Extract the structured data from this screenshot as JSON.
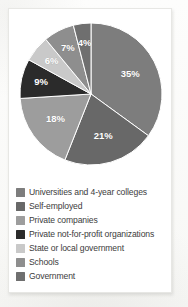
{
  "chart_data": {
    "type": "pie",
    "title": "",
    "labels": [
      "Universities and 4-year colleges",
      "Self-employed",
      "Private companies",
      "Private not-for-profit organizations",
      "State or local government",
      "Schools",
      "Government"
    ],
    "values": [
      35,
      21,
      18,
      9,
      6,
      7,
      4
    ],
    "value_labels": [
      "35%",
      "21%",
      "18%",
      "9%",
      "6%",
      "7%",
      "4%"
    ],
    "colors": [
      "#7d7d7d",
      "#686868",
      "#9d9d9d",
      "#2b2b2b",
      "#c9c9c9",
      "#8e8e8e",
      "#6f6f6f"
    ],
    "start_angle_deg": 0,
    "direction": "clockwise",
    "legend_position": "bottom",
    "grid": false
  },
  "legend": {
    "items": [
      {
        "label": "Universities and 4-year colleges",
        "color": "#7d7d7d",
        "value_label": "35%"
      },
      {
        "label": "Self-employed",
        "color": "#686868",
        "value_label": "21%"
      },
      {
        "label": "Private companies",
        "color": "#9d9d9d",
        "value_label": "18%"
      },
      {
        "label": "Private not-for-profit organizations",
        "color": "#2b2b2b",
        "value_label": "9%"
      },
      {
        "label": "State or local government",
        "color": "#c9c9c9",
        "value_label": "6%"
      },
      {
        "label": "Schools",
        "color": "#8e8e8e",
        "value_label": "7%"
      },
      {
        "label": "Government",
        "color": "#6f6f6f",
        "value_label": "4%"
      }
    ]
  }
}
